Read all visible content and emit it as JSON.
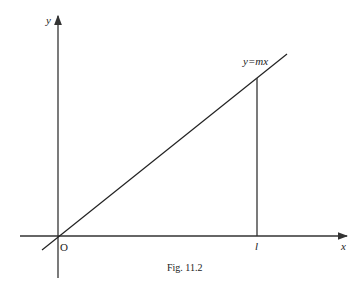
{
  "figure": {
    "caption": "Fig. 11.2",
    "y_axis_label": "y",
    "x_axis_label": "x",
    "origin_label": "O",
    "line_label": "y=mx",
    "point_label": "l"
  }
}
